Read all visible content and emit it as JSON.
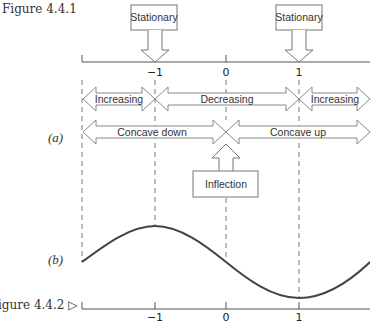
{
  "figure_top_label": "Figure 4.4.1",
  "figure_bottom_label": "igure 4.4.2 ▷",
  "part_a": "(a)",
  "part_b": "(b)",
  "callouts": {
    "stationary_left": "Stationary",
    "stationary_right": "Stationary",
    "inflection": "Inflection"
  },
  "intervals": {
    "increasing_left": "Increasing",
    "decreasing": "Decreasing",
    "increasing_right": "Increasing",
    "concave_down": "Concave down",
    "concave_up": "Concave up"
  },
  "axis_ticks": [
    "−1",
    "0",
    "1"
  ],
  "colors": {
    "line": "#8a8a8a",
    "curve": "#444444",
    "axis": "#555555"
  }
}
